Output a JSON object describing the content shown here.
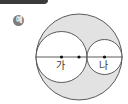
{
  "header": {
    "badge_label": "예"
  },
  "figure": {
    "outer_circle": {
      "cx": 79,
      "cy": 57,
      "r": 43,
      "fill": "#e2e2e2"
    },
    "circle_ga": {
      "label": "가",
      "cx": 61.5,
      "cy": 57,
      "r": 25.5,
      "fill": "#ffffff"
    },
    "circle_na": {
      "label": "나",
      "cx": 104.5,
      "cy": 57,
      "r": 17.5,
      "fill": "#ffffff"
    },
    "center_points": [
      {
        "name": "center-ga",
        "x": 61.5,
        "y": 57
      },
      {
        "name": "center-outer",
        "x": 79,
        "y": 57
      },
      {
        "name": "center-na",
        "x": 104.5,
        "y": 57
      }
    ],
    "stroke_color": "#333333"
  }
}
